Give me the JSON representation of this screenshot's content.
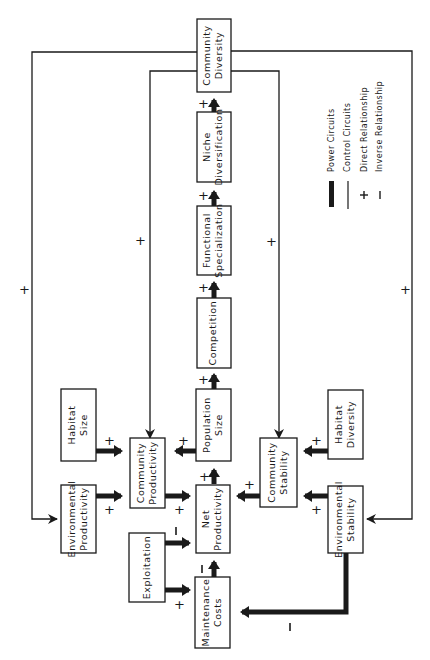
{
  "diagram": {
    "nodes": {
      "community_diversity": [
        "Community",
        "Diversity"
      ],
      "niche_diversification": [
        "Niche",
        "Diversification"
      ],
      "functional_specialization": [
        "Functional",
        "Specialization"
      ],
      "competition": [
        "Competition"
      ],
      "population_size": [
        "Population",
        "Size"
      ],
      "habitat_size": [
        "Habitat",
        "Size"
      ],
      "community_productivity": [
        "Community",
        "Productivity"
      ],
      "environmental_productivity": [
        "Environmental",
        "Productivity"
      ],
      "net_productivity": [
        "Net",
        "Productivity"
      ],
      "community_stability": [
        "Community",
        "Stability"
      ],
      "habitat_diversity": [
        "Habitat",
        "Diversity"
      ],
      "environmental_stability": [
        "Environmental",
        "Stability"
      ],
      "exploitation": [
        "Exploitation"
      ],
      "maintenance_costs": [
        "Maintenance",
        "Costs"
      ]
    },
    "signs": {
      "plus": "+",
      "minus": "−"
    },
    "edges": [
      {
        "from": "Niche Diversification",
        "to": "Community Diversity",
        "type": "power",
        "sign": "+"
      },
      {
        "from": "Functional Specialization",
        "to": "Niche Diversification",
        "type": "power",
        "sign": "+"
      },
      {
        "from": "Competition",
        "to": "Functional Specialization",
        "type": "power",
        "sign": "+"
      },
      {
        "from": "Population Size",
        "to": "Competition",
        "type": "power",
        "sign": "+"
      },
      {
        "from": "Net Productivity",
        "to": "Population Size",
        "type": "power",
        "sign": "+"
      },
      {
        "from": "Population Size",
        "to": "Community Productivity",
        "type": "power",
        "sign": "+"
      },
      {
        "from": "Habitat Size",
        "to": "Community Productivity",
        "type": "power",
        "sign": "+"
      },
      {
        "from": "Environmental Productivity",
        "to": "Community Productivity",
        "type": "power",
        "sign": "+"
      },
      {
        "from": "Community Productivity",
        "to": "Net Productivity",
        "type": "power",
        "sign": "+"
      },
      {
        "from": "Community Stability",
        "to": "Net Productivity",
        "type": "power",
        "sign": "+"
      },
      {
        "from": "Habitat Diversity",
        "to": "Community Stability",
        "type": "power",
        "sign": "+"
      },
      {
        "from": "Environmental Stability",
        "to": "Community Stability",
        "type": "power",
        "sign": "+"
      },
      {
        "from": "Exploitation",
        "to": "Net Productivity",
        "type": "power",
        "sign": "−"
      },
      {
        "from": "Exploitation",
        "to": "Maintenance Costs",
        "type": "power",
        "sign": "+"
      },
      {
        "from": "Maintenance Costs",
        "to": "Net Productivity",
        "type": "power",
        "sign": "−"
      },
      {
        "from": "Environmental Stability",
        "to": "Maintenance Costs",
        "type": "power",
        "sign": "−"
      },
      {
        "from": "Community Diversity",
        "to": "Community Productivity",
        "type": "control",
        "sign": "+"
      },
      {
        "from": "Community Diversity",
        "to": "Community Stability",
        "type": "control",
        "sign": "+"
      },
      {
        "from": "Community Diversity",
        "to": "Environmental Productivity",
        "type": "control",
        "sign": "+"
      },
      {
        "from": "Community Diversity",
        "to": "Environmental Stability",
        "type": "control",
        "sign": "+"
      }
    ],
    "legend": {
      "power": "Power Circuits",
      "control": "Control Circuits",
      "direct": "Direct Relationship",
      "inverse": "Inverse Relationship"
    }
  }
}
